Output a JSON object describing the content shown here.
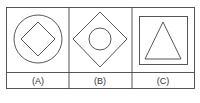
{
  "figure": {
    "stroke_color": "#444444",
    "panels": [
      {
        "label": "(A)",
        "outer_shape": "circle",
        "inner_shape": "diamond"
      },
      {
        "label": "(B)",
        "outer_shape": "diamond",
        "inner_shape": "circle"
      },
      {
        "label": "(C)",
        "outer_shape": "square",
        "inner_shape": "triangle"
      }
    ]
  }
}
